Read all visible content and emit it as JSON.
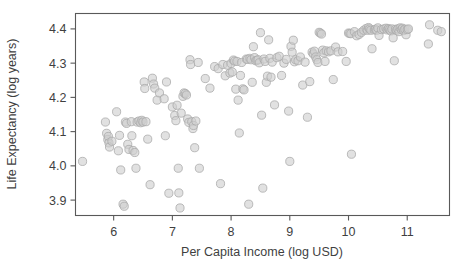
{
  "figure": {
    "kind": "scatter-plot",
    "width": 463,
    "height": 274,
    "background_color": "#ffffff"
  },
  "labels": {
    "ylabel": "Life Expectancy (log years)",
    "xlabel": "Per Capita Income (log USD)"
  },
  "axes": {
    "x_ticks": [
      "6",
      "7",
      "8",
      "9",
      "10",
      "11"
    ],
    "y_ticks": [
      "3.9",
      "4.0",
      "4.1",
      "4.2",
      "4.3",
      "4.4"
    ],
    "frame_color": "#595959",
    "text_color": "#3f3f3f"
  },
  "marker": {
    "fill_color": "#cfcfcf",
    "stroke_color": "#a8a8a8",
    "radius_px": 4.1,
    "fill_opacity": 0.62
  },
  "chart_data": {
    "type": "scatter",
    "title": "",
    "xlabel": "Per Capita Income (log USD)",
    "ylabel": "Life Expectancy (log years)",
    "xlim": [
      5.35,
      11.72
    ],
    "ylim": [
      3.855,
      4.445
    ],
    "xticks": [
      6,
      7,
      8,
      9,
      10,
      11
    ],
    "yticks": [
      3.9,
      4.0,
      4.1,
      4.2,
      4.3,
      4.4
    ],
    "grid": false,
    "legend": null,
    "n_points": 190,
    "series": [
      {
        "name": "countries",
        "points": [
          [
            5.47,
            4.013
          ],
          [
            5.86,
            4.128
          ],
          [
            5.88,
            4.095
          ],
          [
            5.9,
            4.077
          ],
          [
            5.91,
            4.086
          ],
          [
            5.92,
            4.067
          ],
          [
            5.93,
            4.055
          ],
          [
            5.97,
            4.072
          ],
          [
            6.05,
            4.158
          ],
          [
            6.08,
            4.044
          ],
          [
            6.1,
            4.089
          ],
          [
            6.12,
            3.988
          ],
          [
            6.16,
            3.888
          ],
          [
            6.18,
            3.882
          ],
          [
            6.2,
            4.128
          ],
          [
            6.22,
            4.124
          ],
          [
            6.24,
            4.063
          ],
          [
            6.26,
            4.048
          ],
          [
            6.3,
            4.129
          ],
          [
            6.31,
            4.088
          ],
          [
            6.33,
            4.045
          ],
          [
            6.36,
            4.039
          ],
          [
            6.38,
            3.993
          ],
          [
            6.4,
            4.128
          ],
          [
            6.43,
            4.131
          ],
          [
            6.46,
            4.126
          ],
          [
            6.48,
            4.133
          ],
          [
            6.5,
            4.128
          ],
          [
            6.52,
            4.245
          ],
          [
            6.53,
            4.226
          ],
          [
            6.55,
            4.129
          ],
          [
            6.58,
            4.078
          ],
          [
            6.62,
            3.945
          ],
          [
            6.66,
            4.256
          ],
          [
            6.68,
            4.239
          ],
          [
            6.7,
            4.227
          ],
          [
            6.74,
            4.192
          ],
          [
            6.78,
            4.213
          ],
          [
            6.86,
            4.196
          ],
          [
            6.88,
            4.088
          ],
          [
            6.9,
            4.245
          ],
          [
            6.94,
            3.92
          ],
          [
            7.0,
            4.172
          ],
          [
            7.04,
            4.147
          ],
          [
            7.06,
            4.132
          ],
          [
            7.08,
            4.177
          ],
          [
            7.1,
            3.993
          ],
          [
            7.11,
            3.921
          ],
          [
            7.13,
            3.877
          ],
          [
            7.15,
            4.154
          ],
          [
            7.18,
            4.203
          ],
          [
            7.2,
            4.213
          ],
          [
            7.22,
            4.211
          ],
          [
            7.24,
            4.207
          ],
          [
            7.26,
            4.137
          ],
          [
            7.28,
            4.127
          ],
          [
            7.3,
            4.31
          ],
          [
            7.31,
            4.296
          ],
          [
            7.33,
            4.129
          ],
          [
            7.35,
            4.109
          ],
          [
            7.36,
            4.118
          ],
          [
            7.38,
            4.053
          ],
          [
            7.4,
            4.131
          ],
          [
            7.44,
            4.302
          ],
          [
            7.46,
            3.993
          ],
          [
            7.56,
            4.255
          ],
          [
            7.64,
            4.227
          ],
          [
            7.72,
            4.29
          ],
          [
            7.78,
            4.284
          ],
          [
            7.82,
            3.948
          ],
          [
            7.86,
            4.296
          ],
          [
            7.9,
            4.263
          ],
          [
            7.94,
            4.294
          ],
          [
            7.98,
            4.271
          ],
          [
            8.0,
            4.299
          ],
          [
            8.02,
            4.274
          ],
          [
            8.04,
            4.309
          ],
          [
            8.06,
            4.306
          ],
          [
            8.08,
            4.224
          ],
          [
            8.1,
            4.305
          ],
          [
            8.12,
            4.192
          ],
          [
            8.14,
            4.096
          ],
          [
            8.16,
            4.264
          ],
          [
            8.18,
            4.302
          ],
          [
            8.2,
            4.225
          ],
          [
            8.22,
            4.222
          ],
          [
            8.26,
            4.312
          ],
          [
            8.28,
            4.311
          ],
          [
            8.3,
            3.888
          ],
          [
            8.32,
            4.314
          ],
          [
            8.34,
            4.31
          ],
          [
            8.36,
            4.244
          ],
          [
            8.38,
            4.348
          ],
          [
            8.4,
            4.316
          ],
          [
            8.42,
            4.307
          ],
          [
            8.44,
            4.308
          ],
          [
            8.46,
            4.31
          ],
          [
            8.48,
            4.301
          ],
          [
            8.5,
            4.389
          ],
          [
            8.52,
            4.148
          ],
          [
            8.54,
            3.935
          ],
          [
            8.56,
            4.312
          ],
          [
            8.58,
            4.305
          ],
          [
            8.6,
            4.244
          ],
          [
            8.62,
            4.262
          ],
          [
            8.64,
            4.368
          ],
          [
            8.66,
            4.314
          ],
          [
            8.68,
            4.259
          ],
          [
            8.7,
            4.303
          ],
          [
            8.74,
            4.178
          ],
          [
            8.78,
            4.316
          ],
          [
            8.82,
            4.32
          ],
          [
            8.86,
            4.264
          ],
          [
            8.9,
            4.3
          ],
          [
            8.94,
            4.311
          ],
          [
            8.98,
            4.16
          ],
          [
            9.0,
            4.013
          ],
          [
            9.02,
            4.349
          ],
          [
            9.04,
            4.332
          ],
          [
            9.06,
            4.367
          ],
          [
            9.08,
            4.304
          ],
          [
            9.1,
            4.31
          ],
          [
            9.14,
            4.307
          ],
          [
            9.18,
            4.318
          ],
          [
            9.22,
            4.236
          ],
          [
            9.26,
            4.303
          ],
          [
            9.3,
            4.142
          ],
          [
            9.34,
            4.246
          ],
          [
            9.38,
            4.332
          ],
          [
            9.4,
            4.327
          ],
          [
            9.42,
            4.335
          ],
          [
            9.44,
            4.318
          ],
          [
            9.46,
            4.31
          ],
          [
            9.48,
            4.302
          ],
          [
            9.5,
            4.39
          ],
          [
            9.52,
            4.388
          ],
          [
            9.54,
            4.385
          ],
          [
            9.56,
            4.338
          ],
          [
            9.58,
            4.33
          ],
          [
            9.6,
            4.305
          ],
          [
            9.62,
            4.336
          ],
          [
            9.66,
            4.333
          ],
          [
            9.7,
            4.336
          ],
          [
            9.74,
            4.252
          ],
          [
            9.78,
            4.347
          ],
          [
            9.82,
            4.333
          ],
          [
            9.9,
            4.334
          ],
          [
            9.96,
            4.305
          ],
          [
            10.0,
            4.388
          ],
          [
            10.02,
            4.387
          ],
          [
            10.04,
            4.386
          ],
          [
            10.05,
            4.034
          ],
          [
            10.1,
            4.392
          ],
          [
            10.14,
            4.38
          ],
          [
            10.18,
            4.384
          ],
          [
            10.22,
            4.39
          ],
          [
            10.26,
            4.396
          ],
          [
            10.3,
            4.401
          ],
          [
            10.32,
            4.396
          ],
          [
            10.34,
            4.404
          ],
          [
            10.36,
            4.4
          ],
          [
            10.38,
            4.396
          ],
          [
            10.4,
            4.342
          ],
          [
            10.44,
            4.397
          ],
          [
            10.46,
            4.399
          ],
          [
            10.48,
            4.396
          ],
          [
            10.5,
            4.403
          ],
          [
            10.52,
            4.381
          ],
          [
            10.56,
            4.398
          ],
          [
            10.6,
            4.4
          ],
          [
            10.64,
            4.402
          ],
          [
            10.66,
            4.397
          ],
          [
            10.68,
            4.401
          ],
          [
            10.7,
            4.398
          ],
          [
            10.72,
            4.394
          ],
          [
            10.74,
            4.4
          ],
          [
            10.76,
            4.374
          ],
          [
            10.78,
            4.307
          ],
          [
            10.8,
            4.399
          ],
          [
            10.82,
            4.396
          ],
          [
            10.84,
            4.4
          ],
          [
            10.86,
            4.392
          ],
          [
            10.88,
            4.403
          ],
          [
            10.9,
            4.398
          ],
          [
            10.92,
            4.402
          ],
          [
            10.94,
            4.395
          ],
          [
            10.96,
            4.399
          ],
          [
            10.98,
            4.383
          ],
          [
            11.0,
            4.398
          ],
          [
            11.02,
            4.4
          ],
          [
            11.36,
            4.356
          ],
          [
            11.38,
            4.412
          ],
          [
            11.52,
            4.396
          ],
          [
            11.58,
            4.392
          ]
        ]
      }
    ]
  }
}
